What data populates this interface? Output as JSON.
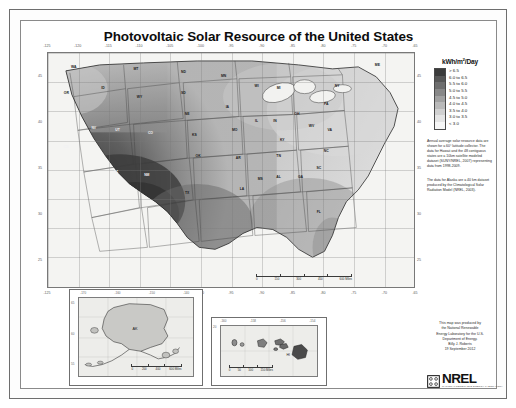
{
  "poster": {
    "title": "Photovoltaic Solar Resource of the United States"
  },
  "legend": {
    "title_main": "kWh/m",
    "title_sup": "2",
    "title_tail": "/Day",
    "entries": [
      {
        "label": "> 6.5",
        "color": "#3b3b3b"
      },
      {
        "label": "6.0 to 6.5",
        "color": "#575757"
      },
      {
        "label": "5.5 to 6.0",
        "color": "#6e6e6e"
      },
      {
        "label": "5.0 to 5.5",
        "color": "#888888"
      },
      {
        "label": "4.5 to 5.0",
        "color": "#a1a1a1"
      },
      {
        "label": "4.0 to 4.5",
        "color": "#b9b9b9"
      },
      {
        "label": "3.5 to 4.0",
        "color": "#d0d0d0"
      },
      {
        "label": "3.0 to 3.5",
        "color": "#e4e4e4"
      },
      {
        "label": "< 3.0",
        "color": "#f6f6f6"
      }
    ],
    "note_1": "Annual average solar resource data are shown for a 60° latitude collector. The data for Hawaii and the 48 contiguous states are a 10km satellite modeled dataset (SUNY/NREL, 2007) representing data from 1998-2009.",
    "note_2": "The data for Alaska are a 40 km dataset produced by the Climatological Solar Radiation Model (NREL, 2003)."
  },
  "credit": {
    "line_1": "This map was produced by",
    "line_2": "the National Renewable",
    "line_3": "Energy Laboratory for the U.S.",
    "line_4": "Department of Energy.",
    "line_5": "Billy J. Roberts",
    "line_6": "19 September 2012"
  },
  "logo": {
    "wordmark": "NREL",
    "tagline": "NATIONAL RENEWABLE ENERGY LABORATORY"
  },
  "main_map": {
    "lon_ticks": [
      "-125",
      "-120",
      "-115",
      "-110",
      "-105",
      "-100",
      "-95",
      "-90",
      "-85",
      "-80",
      "-75",
      "-70",
      "-65"
    ],
    "lat_ticks": [
      "45",
      "40",
      "35",
      "30",
      "25"
    ],
    "scalebar": {
      "labels": [
        "0",
        "150",
        "300",
        "450",
        "600 Miles"
      ]
    },
    "state_labels": [
      {
        "abbr": "WA",
        "x": 7.0,
        "y": 6.0,
        "tone": "dark"
      },
      {
        "abbr": "OR",
        "x": 5.0,
        "y": 17.0,
        "tone": "dark"
      },
      {
        "abbr": "CA",
        "x": 5.0,
        "y": 40.0,
        "tone": "light"
      },
      {
        "abbr": "NV",
        "x": 12.5,
        "y": 32.0,
        "tone": "light"
      },
      {
        "abbr": "ID",
        "x": 15.0,
        "y": 15.0,
        "tone": "dark"
      },
      {
        "abbr": "MT",
        "x": 24.0,
        "y": 7.0,
        "tone": "dark"
      },
      {
        "abbr": "WY",
        "x": 25.0,
        "y": 19.0,
        "tone": "dark"
      },
      {
        "abbr": "UT",
        "x": 19.0,
        "y": 33.0,
        "tone": "light"
      },
      {
        "abbr": "CO",
        "x": 28.0,
        "y": 34.0,
        "tone": "light"
      },
      {
        "abbr": "AZ",
        "x": 18.5,
        "y": 51.0,
        "tone": "light"
      },
      {
        "abbr": "NM",
        "x": 27.0,
        "y": 52.0,
        "tone": "light"
      },
      {
        "abbr": "ND",
        "x": 37.0,
        "y": 8.0,
        "tone": "dark"
      },
      {
        "abbr": "SD",
        "x": 37.0,
        "y": 17.0,
        "tone": "dark"
      },
      {
        "abbr": "NE",
        "x": 38.0,
        "y": 26.0,
        "tone": "dark"
      },
      {
        "abbr": "KS",
        "x": 40.0,
        "y": 35.0,
        "tone": "dark"
      },
      {
        "abbr": "OK",
        "x": 41.0,
        "y": 44.0,
        "tone": "dark"
      },
      {
        "abbr": "TX",
        "x": 38.0,
        "y": 60.0,
        "tone": "dark"
      },
      {
        "abbr": "MN",
        "x": 48.0,
        "y": 10.0,
        "tone": "dark"
      },
      {
        "abbr": "IA",
        "x": 49.0,
        "y": 23.0,
        "tone": "dark"
      },
      {
        "abbr": "MO",
        "x": 51.0,
        "y": 33.0,
        "tone": "dark"
      },
      {
        "abbr": "AR",
        "x": 52.0,
        "y": 45.0,
        "tone": "dark"
      },
      {
        "abbr": "LA",
        "x": 53.0,
        "y": 58.0,
        "tone": "dark"
      },
      {
        "abbr": "WI",
        "x": 57.0,
        "y": 14.0,
        "tone": "dark"
      },
      {
        "abbr": "IL",
        "x": 57.0,
        "y": 29.0,
        "tone": "dark"
      },
      {
        "abbr": "MS",
        "x": 58.0,
        "y": 54.0,
        "tone": "dark"
      },
      {
        "abbr": "MI",
        "x": 63.0,
        "y": 15.0,
        "tone": "dark"
      },
      {
        "abbr": "IN",
        "x": 62.0,
        "y": 29.0,
        "tone": "dark"
      },
      {
        "abbr": "KY",
        "x": 64.0,
        "y": 37.0,
        "tone": "dark"
      },
      {
        "abbr": "TN",
        "x": 63.0,
        "y": 44.0,
        "tone": "dark"
      },
      {
        "abbr": "AL",
        "x": 63.0,
        "y": 53.0,
        "tone": "dark"
      },
      {
        "abbr": "OH",
        "x": 68.0,
        "y": 26.0,
        "tone": "dark"
      },
      {
        "abbr": "GA",
        "x": 69.0,
        "y": 53.0,
        "tone": "dark"
      },
      {
        "abbr": "FL",
        "x": 74.0,
        "y": 68.0,
        "tone": "dark"
      },
      {
        "abbr": "WV",
        "x": 72.0,
        "y": 31.0,
        "tone": "dark"
      },
      {
        "abbr": "VA",
        "x": 77.0,
        "y": 33.0,
        "tone": "dark"
      },
      {
        "abbr": "NC",
        "x": 76.0,
        "y": 42.0,
        "tone": "dark"
      },
      {
        "abbr": "SC",
        "x": 74.0,
        "y": 49.0,
        "tone": "dark"
      },
      {
        "abbr": "PA",
        "x": 76.0,
        "y": 22.0,
        "tone": "dark"
      },
      {
        "abbr": "NY",
        "x": 79.0,
        "y": 14.0,
        "tone": "dark"
      },
      {
        "abbr": "ME",
        "x": 90.0,
        "y": 5.0,
        "tone": "dark"
      }
    ]
  },
  "alaska_inset": {
    "label": "AK",
    "lon_ticks": [
      "-170",
      "-160",
      "-150",
      "-140"
    ],
    "lat_ticks": [
      "65",
      "60",
      "55"
    ],
    "scalebar": {
      "labels": [
        "0",
        "200",
        "400",
        "600 Miles"
      ]
    }
  },
  "hawaii_inset": {
    "label": "HI",
    "lon_ticks": [
      "-160",
      "-158",
      "-156",
      "-154"
    ],
    "lat_ticks": [
      "20"
    ],
    "scalebar": {
      "labels": [
        "0",
        "50",
        "100",
        "150 Miles"
      ]
    }
  }
}
